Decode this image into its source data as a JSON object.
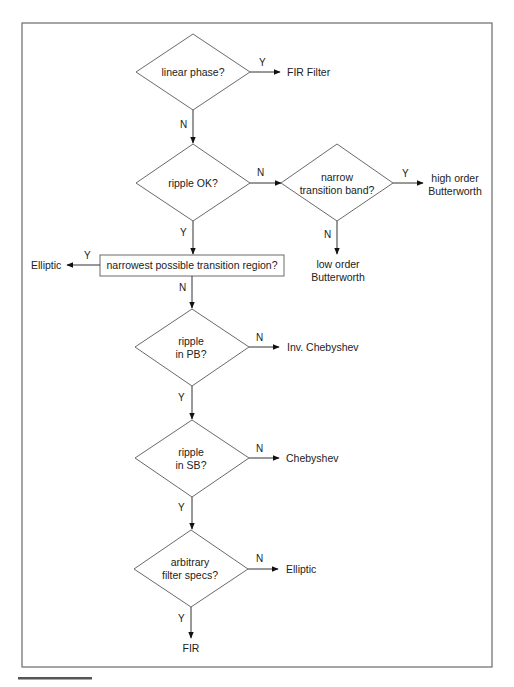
{
  "diagram": {
    "type": "flowchart",
    "title": "",
    "decisions": [
      {
        "id": "d1",
        "text": [
          "linear phase?"
        ]
      },
      {
        "id": "d2",
        "text": [
          "ripple OK?"
        ]
      },
      {
        "id": "d3",
        "text": [
          "narrow",
          "transition band?"
        ]
      },
      {
        "id": "d4",
        "text": [
          "ripple",
          "in PB?"
        ]
      },
      {
        "id": "d5",
        "text": [
          "ripple",
          "in SB?"
        ]
      },
      {
        "id": "d6",
        "text": [
          "arbitrary",
          "filter specs?"
        ]
      }
    ],
    "process": {
      "id": "p1",
      "text": "narrowest possible transition region?"
    },
    "outcomes": [
      {
        "id": "o1",
        "text": [
          "FIR Filter"
        ]
      },
      {
        "id": "o2",
        "text": [
          "high order",
          "Butterworth"
        ]
      },
      {
        "id": "o3",
        "text": [
          "low order",
          "Butterworth"
        ]
      },
      {
        "id": "o4",
        "text": [
          "Elliptic"
        ]
      },
      {
        "id": "o5",
        "text": [
          "Inv. Chebyshev"
        ]
      },
      {
        "id": "o6",
        "text": [
          "Chebyshev"
        ]
      },
      {
        "id": "o7",
        "text": [
          "Elliptic"
        ]
      },
      {
        "id": "o8",
        "text": [
          "FIR"
        ]
      }
    ],
    "edges": [
      {
        "from": "d1",
        "to": "o1",
        "label": "Y"
      },
      {
        "from": "d1",
        "to": "d2",
        "label": "N"
      },
      {
        "from": "d2",
        "to": "d3",
        "label": "N"
      },
      {
        "from": "d3",
        "to": "o2",
        "label": "Y"
      },
      {
        "from": "d3",
        "to": "o3",
        "label": "N"
      },
      {
        "from": "d2",
        "to": "p1",
        "label": "Y"
      },
      {
        "from": "p1",
        "to": "o4",
        "label": "Y"
      },
      {
        "from": "p1",
        "to": "d4",
        "label": "N"
      },
      {
        "from": "d4",
        "to": "o5",
        "label": "N"
      },
      {
        "from": "d4",
        "to": "d5",
        "label": "Y"
      },
      {
        "from": "d5",
        "to": "o6",
        "label": "N"
      },
      {
        "from": "d5",
        "to": "d6",
        "label": "Y"
      },
      {
        "from": "d6",
        "to": "o7",
        "label": "N"
      },
      {
        "from": "d6",
        "to": "o8",
        "label": "Y"
      }
    ]
  },
  "colors": {
    "frame": "#6a6a6a",
    "shape_stroke": "#6a6a6a",
    "edge": "#333333",
    "text": "#222222",
    "background": "#ffffff"
  }
}
